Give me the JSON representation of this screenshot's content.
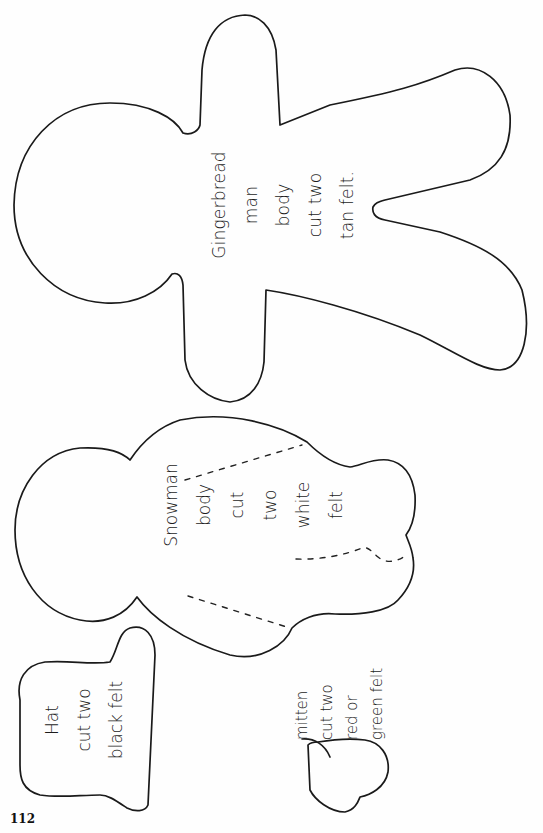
{
  "page": {
    "page_number": "112",
    "background": "#ffffff",
    "ink_color": "#1a1a1a"
  },
  "patterns": {
    "gingerbread": {
      "lines": [
        "Gingerbread",
        "man",
        "body",
        "cut two",
        "tan felt."
      ]
    },
    "snowman": {
      "lines": [
        "Snowman",
        "body",
        "cut",
        "two",
        "white",
        "felt"
      ]
    },
    "hat": {
      "lines": [
        "Hat",
        "cut two",
        "black felt"
      ]
    },
    "mitten": {
      "lines": [
        "mitten",
        "cut two",
        "red or",
        "green felt"
      ]
    }
  }
}
